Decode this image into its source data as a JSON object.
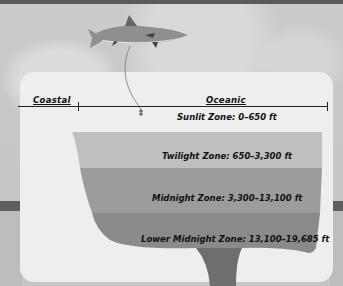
{
  "diagram": {
    "regions": [
      {
        "label": "Coastal"
      },
      {
        "label": "Oceanic"
      }
    ],
    "zones": [
      {
        "name": "Sunlit Zone",
        "range": "0–650 ft",
        "label": "Sunlit Zone: 0–650 ft",
        "color": "#eeeeee"
      },
      {
        "name": "Twilight Zone",
        "range": "650–3,300 ft",
        "label": "Twilight Zone: 650–3,300 ft",
        "color": "#bfbfbf"
      },
      {
        "name": "Midnight Zone",
        "range": "3,300–13,100 ft",
        "label": "Midnight Zone: 3,300–13,100 ft",
        "color": "#9c9c9c"
      },
      {
        "name": "Lower Midnight Zone",
        "range": "13,100–19,685 ft",
        "label": "Lower Midnight Zone: 13,100–19,685 ft",
        "color": "#8a8a8a"
      }
    ],
    "trench_color": "#6e6e6e",
    "illustration": "shark-icon"
  }
}
